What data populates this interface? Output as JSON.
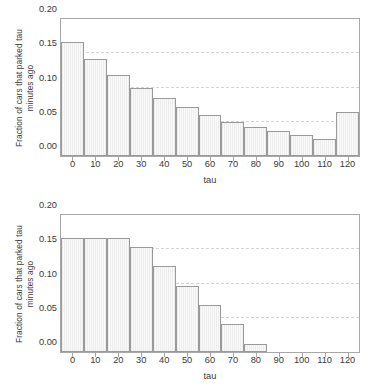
{
  "figure": {
    "background": "#ffffff",
    "bar_fill": "#f4f4f4",
    "bar_edge": "#9a9a9a",
    "grid_color": "#d3d3d3",
    "axis_color": "#a8a8a8",
    "text_color": "#3a3a3a",
    "clipped_top_title": ""
  },
  "chart_data": [
    {
      "type": "bar",
      "panel": "top",
      "title": "",
      "xlabel": "tau",
      "ylabel": "Fraction of cars that parked tau minutes ago",
      "ylabel_line1": "Fraction of cars that parked tau",
      "ylabel_line2": "minutes ago",
      "categories": [
        0,
        10,
        20,
        30,
        40,
        50,
        60,
        70,
        80,
        90,
        100,
        110,
        120
      ],
      "xtick_labels": [
        "0",
        "10",
        "20",
        "30",
        "40",
        "50",
        "60",
        "70",
        "80",
        "90",
        "100",
        "110",
        "120"
      ],
      "values": [
        0.167,
        0.141,
        0.118,
        0.1,
        0.085,
        0.071,
        0.06,
        0.05,
        0.043,
        0.036,
        0.03,
        0.025,
        0.064
      ],
      "ylim": [
        0.0,
        0.2
      ],
      "xlim": [
        -5,
        125
      ],
      "ytick_values": [
        0.0,
        0.05,
        0.1,
        0.15,
        0.2
      ],
      "ytick_labels": [
        "0.00",
        "0.05",
        "0.10",
        "0.15",
        "0.20"
      ],
      "gridlines_y": [
        0.05,
        0.1,
        0.15
      ],
      "grid": true,
      "legend": "none",
      "bar_width": 10
    },
    {
      "type": "bar",
      "panel": "bottom",
      "title": "",
      "xlabel": "tau",
      "ylabel": "Fraction of cars that parked tau minutes ago",
      "ylabel_line1": "Fraction of cars that parked tau",
      "ylabel_line2": "minutes ago",
      "categories": [
        0,
        10,
        20,
        30,
        40,
        50,
        60,
        70,
        80,
        90,
        100,
        110,
        120
      ],
      "xtick_labels": [
        "0",
        "10",
        "20",
        "30",
        "40",
        "50",
        "60",
        "70",
        "80",
        "90",
        "100",
        "110",
        "120"
      ],
      "values": [
        0.167,
        0.167,
        0.167,
        0.153,
        0.125,
        0.097,
        0.068,
        0.041,
        0.012,
        0.0,
        0.0,
        0.0,
        0.0
      ],
      "ylim": [
        0.0,
        0.2
      ],
      "xlim": [
        -5,
        125
      ],
      "ytick_values": [
        0.0,
        0.05,
        0.1,
        0.15,
        0.2
      ],
      "ytick_labels": [
        "0.00",
        "0.05",
        "0.10",
        "0.15",
        "0.20"
      ],
      "gridlines_y": [
        0.05,
        0.1,
        0.15
      ],
      "grid": true,
      "legend": "none",
      "bar_width": 10
    }
  ]
}
